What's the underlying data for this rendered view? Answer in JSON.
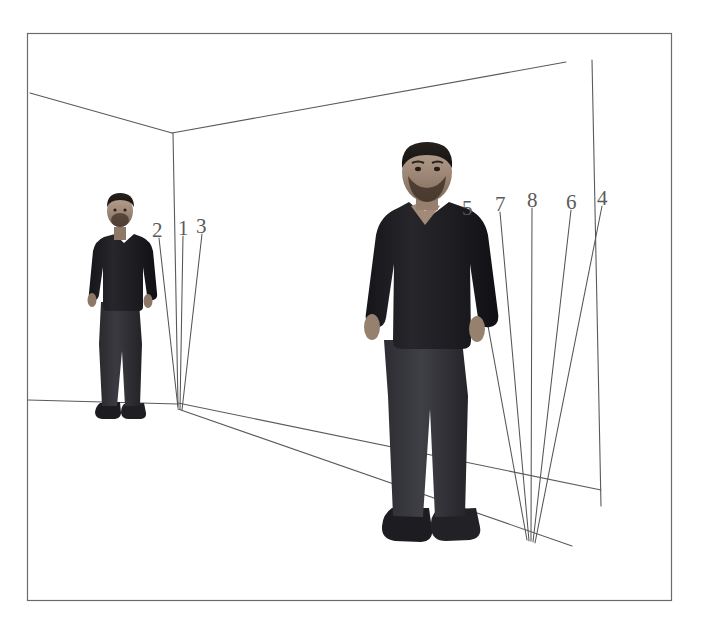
{
  "figure": {
    "title": "",
    "background_color": "#ffffff",
    "border_color": "#6b6b6b",
    "line_color": "#555555",
    "label_color": "#5a5a5a",
    "width": 705,
    "height": 631
  },
  "diagram": {
    "type": "3d-room-perspective-annotation",
    "outer_frame": {
      "x": 27,
      "y": 33,
      "width": 645,
      "height": 568
    },
    "room": {
      "corner_vertical_top": {
        "x": 172,
        "y": 133
      },
      "corner_vertical_bottom": {
        "x": 178,
        "y": 405
      },
      "ceiling_left_end": {
        "x": 30,
        "y": 93
      },
      "ceiling_right_end": {
        "x": 565,
        "y": 62
      },
      "floor_left_end": {
        "x": 27,
        "y": 400
      },
      "right_wall_edge_top": {
        "x": 592,
        "y": 60
      },
      "right_wall_edge_bottom": {
        "x": 601,
        "y": 506
      }
    }
  },
  "people": [
    {
      "id": "person-left",
      "name": "standing-person-far",
      "bbox": {
        "x": 86,
        "y": 194,
        "width": 66,
        "height": 228
      }
    },
    {
      "id": "person-right",
      "name": "standing-person-near",
      "bbox": {
        "x": 368,
        "y": 146,
        "width": 124,
        "height": 406
      }
    }
  ],
  "annotation_lines": [
    {
      "label": "2",
      "label_x": 152,
      "label_y": 220,
      "x1": 159,
      "y1": 238,
      "x2": 178,
      "y2": 408
    },
    {
      "label": "1",
      "label_x": 178,
      "label_y": 218,
      "x1": 183,
      "y1": 236,
      "x2": 180,
      "y2": 409
    },
    {
      "label": "3",
      "label_x": 196,
      "label_y": 216,
      "x1": 202,
      "y1": 234,
      "x2": 182,
      "y2": 410
    },
    {
      "label": "5",
      "label_x": 462,
      "label_y": 198,
      "x1": 468,
      "y1": 216,
      "x2": 527,
      "y2": 540
    },
    {
      "label": "7",
      "label_x": 495,
      "label_y": 194,
      "x1": 500,
      "y1": 212,
      "x2": 529,
      "y2": 541
    },
    {
      "label": "8",
      "label_x": 527,
      "label_y": 190,
      "x1": 532,
      "y1": 208,
      "x2": 531,
      "y2": 541
    },
    {
      "label": "6",
      "label_x": 566,
      "label_y": 192,
      "x1": 571,
      "y1": 210,
      "x2": 533,
      "y2": 542
    },
    {
      "label": "4",
      "label_x": 597,
      "label_y": 188,
      "x1": 602,
      "y1": 206,
      "x2": 535,
      "y2": 543
    }
  ],
  "floor_lines": [
    {
      "name": "baseboard-left",
      "x1": 27,
      "y1": 400,
      "x2": 178,
      "y2": 404
    },
    {
      "name": "baseboard-right-upper",
      "x1": 178,
      "y1": 403,
      "x2": 601,
      "y2": 490
    },
    {
      "name": "floor-edge-right-lower",
      "x1": 178,
      "y1": 409,
      "x2": 572,
      "y2": 546
    }
  ]
}
